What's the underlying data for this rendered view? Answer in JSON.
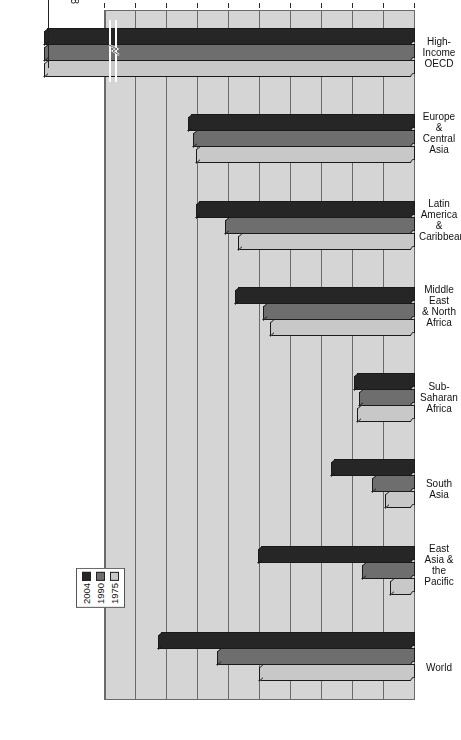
{
  "chart_data": {
    "type": "bar",
    "orientation": "horizontal",
    "title": "",
    "xlabel": "(2004 purchasing power parity in thousands of U.S. dollars)",
    "ylabel": "",
    "xlim": [
      0,
      10
    ],
    "xticks": [
      "0",
      "1",
      "2",
      "3",
      "4",
      "5",
      "6",
      "7",
      "8",
      "9",
      "10"
    ],
    "grid": "vertical",
    "axis_break": true,
    "axis_break_note": "High-Income OECD bars extend beyond the 10 limit; axis is broken near 9.7",
    "legend_position": "inside-left",
    "categories": [
      "World",
      "East Asia &\nthe Pacific",
      "South Asia",
      "Sub-Saharan\nAfrica",
      "Middle East\n& North Africa",
      "Latin America\n& Caribbean",
      "Europe &\nCentral Asia",
      "High-Income\nOECD"
    ],
    "series": [
      {
        "name": "1975",
        "color": "#c8c8c8",
        "values": [
          4.95,
          0.72,
          0.88,
          1.78,
          4.58,
          5.62,
          6.98,
          15.76442
        ]
      },
      {
        "name": "1990",
        "color": "#6e6e6e",
        "values": [
          6.28,
          1.6,
          1.28,
          1.7,
          4.8,
          6.02,
          7.08,
          23.09569
        ]
      },
      {
        "name": "2004",
        "color": "#262626",
        "values": [
          8.18,
          4.98,
          2.62,
          1.88,
          5.72,
          6.98,
          7.22,
          29.41298
        ]
      }
    ],
    "annotations": [
      {
        "series": "2004",
        "category": "High-Income OECD",
        "label": "$29412.98"
      },
      {
        "series": "1990",
        "category": "High-Income OECD",
        "label": "$23095.69"
      },
      {
        "series": "1975",
        "category": "High-Income OECD",
        "label": "$15764.42"
      }
    ]
  },
  "axis": {
    "value_axis_title": "(2004 purchasing power parity in thousands of U.S. dollars)",
    "tick_labels": [
      "0",
      "1",
      "2",
      "3",
      "4",
      "5",
      "6",
      "7",
      "8",
      "9",
      "10"
    ]
  },
  "categories": {
    "c0": "World",
    "c1_line1": "East Asia &",
    "c1_line2": "the Pacific",
    "c2": "South Asia",
    "c3_line1": "Sub-Saharan",
    "c3_line2": "Africa",
    "c4_line1": "Middle East",
    "c4_line2": "& North Africa",
    "c5_line1": "Latin America",
    "c5_line2": "& Caribbean",
    "c6_line1": "Europe &",
    "c6_line2": "Central Asia",
    "c7_line1": "High-Income",
    "c7_line2": "OECD"
  },
  "legend": {
    "items": [
      {
        "label": "1975",
        "color": "#c8c8c8"
      },
      {
        "label": "1990",
        "color": "#6e6e6e"
      },
      {
        "label": "2004",
        "color": "#262626"
      }
    ],
    "l0": "1975",
    "l1": "1990",
    "l2": "2004"
  },
  "callouts": {
    "a0": "$29412.98",
    "a1": "$23095.69",
    "a2": "$15764.42"
  },
  "colors": {
    "plot_bg": "#d5d5d5",
    "grid": "#6a6a6a",
    "s1975": "#c8c8c8",
    "s1990": "#6e6e6e",
    "s2004": "#262626",
    "page_bg": "#ffffff"
  }
}
